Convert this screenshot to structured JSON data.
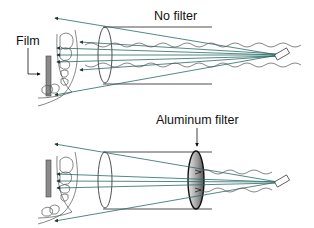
{
  "diagram": {
    "panels": [
      {
        "id": "no-filter",
        "title": "No filter",
        "side_label": "Film"
      },
      {
        "id": "aluminum-filter",
        "title": "Aluminum filter"
      }
    ],
    "colors": {
      "beam": "#2a6a66",
      "outline": "#222222",
      "film": "#8a8a8a",
      "filter_fill": "#9a9a9a",
      "wave": "#555555"
    }
  }
}
